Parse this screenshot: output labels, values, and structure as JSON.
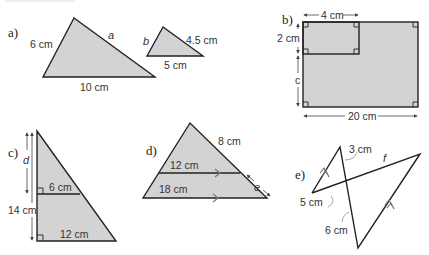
{
  "header": {
    "faint_text": ""
  },
  "parts": {
    "a": {
      "label": "a)",
      "big_triangle": {
        "left_side": "6 cm",
        "right_side": "a",
        "base": "10 cm"
      },
      "small_triangle": {
        "left_side": "b",
        "right_side": "4.5 cm",
        "base": "5 cm"
      }
    },
    "b": {
      "label": "b)",
      "top_width": "4 cm",
      "inner_height": "2 cm",
      "unknown_height": "c",
      "total_width": "20 cm"
    },
    "c": {
      "label": "c)",
      "upper_height": "d",
      "total_height": "14 cm",
      "mid_width": "6 cm",
      "base_width": "12 cm"
    },
    "d": {
      "label": "d)",
      "upper_side": "8 cm",
      "mid_width": "12 cm",
      "base_width": "18 cm",
      "lower_side": "e"
    },
    "e": {
      "label": "e)",
      "top_segment": "3 cm",
      "long_segment": "f",
      "left_segment": "5 cm",
      "lower_segment": "6 cm"
    }
  },
  "colors": {
    "fill": "#d3d3d3",
    "stroke": "#222222",
    "arrow": "#777777"
  }
}
